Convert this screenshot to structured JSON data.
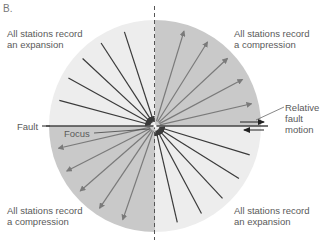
{
  "panel_label": "B.",
  "quadrants": {
    "upper_left": {
      "line1": "All stations record",
      "line2": "an expansion"
    },
    "upper_right": {
      "line1": "All stations record",
      "line2": "a compression"
    },
    "lower_left": {
      "line1": "All stations record",
      "line2": "a compression"
    },
    "lower_right": {
      "line1": "All stations record",
      "line2": "an expansion"
    }
  },
  "labels": {
    "fault": "Fault",
    "focus": "Focus",
    "relative_fault_motion": [
      "Relative",
      "fault",
      "motion"
    ]
  },
  "colors": {
    "compression_fill": "#c9c9c9",
    "expansion_fill": "#ededed",
    "inward_ray": "#3a3a3a",
    "outward_ray": "#7a7a7a",
    "fault_line": "#444444"
  },
  "geometry": {
    "center": [
      155,
      126
    ],
    "radius": 106,
    "inward_angles_deg_upper_left": [
      165,
      151,
      137,
      123,
      108
    ],
    "outward_angles_deg_upper_right": [
      73,
      58,
      43,
      28,
      13
    ],
    "outward_angles_deg_lower_left": [
      -167,
      -153,
      -139,
      -124,
      -109
    ],
    "inward_angles_deg_lower_right": [
      -17,
      -32,
      -47,
      -62,
      -77
    ]
  }
}
